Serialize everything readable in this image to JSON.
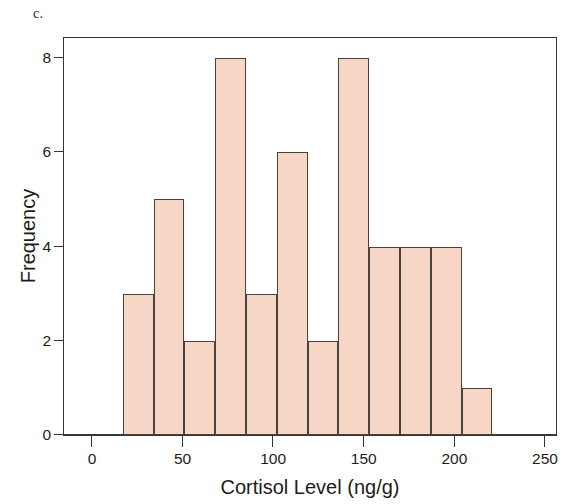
{
  "panel": {
    "letter": "c."
  },
  "chart_data": {
    "type": "bar",
    "subtype": "histogram",
    "title": "",
    "xlabel": "Cortisol Level (ng/g)",
    "ylabel": "Frequency",
    "xlim": [
      0,
      250
    ],
    "ylim": [
      0,
      8.45
    ],
    "xticks": [
      0,
      50,
      100,
      150,
      200,
      250
    ],
    "xtick_labels": [
      "0",
      "50",
      "100",
      "150",
      "200",
      "250"
    ],
    "yticks": [
      0,
      2,
      4,
      6,
      8
    ],
    "ytick_labels": [
      "0",
      "2",
      "4",
      "6",
      "8"
    ],
    "grid": false,
    "legend": false,
    "bin_width": 17,
    "bin_edges": [
      17,
      34,
      51,
      68,
      85,
      102,
      119,
      136,
      153,
      170,
      187,
      204,
      221
    ],
    "categories": [
      "17-34",
      "34-51",
      "51-68",
      "68-85",
      "85-102",
      "102-119",
      "119-136",
      "136-153",
      "153-170",
      "170-187",
      "187-204",
      "204-221"
    ],
    "values": [
      3,
      5,
      2,
      8,
      3,
      6,
      2,
      8,
      4,
      4,
      4,
      1
    ],
    "bar_fill": "#f7d6c6",
    "bar_edge": "#4a403c",
    "axis_color": "#3a3533",
    "total_count": 50
  }
}
